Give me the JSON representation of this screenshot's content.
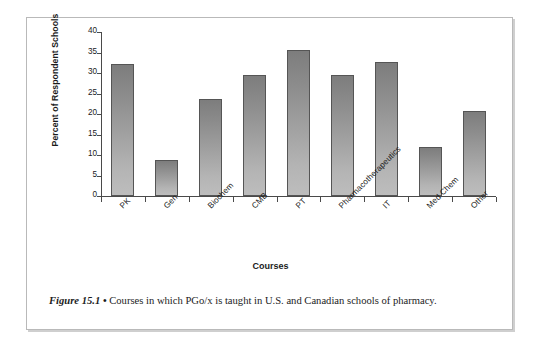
{
  "figure": {
    "caption_label": "Figure 15.1",
    "caption_bullet": "•",
    "caption_text": "Courses in which PGo/x is taught in U.S. and Canadian schools of pharmacy."
  },
  "colors": {
    "bar_top": "#7d7d7d",
    "bar_bottom": "#bdbdbd",
    "bar_border": "#555555",
    "axis": "#4a4a4a",
    "text": "#1b1b1b",
    "frame": "#b9b9b9",
    "background": "#ffffff"
  },
  "chart_data": {
    "type": "bar",
    "title": "",
    "xlabel": "Courses",
    "ylabel": "Percent of Respondent Schools",
    "ylim": [
      0,
      40
    ],
    "yticks": [
      0,
      5,
      10,
      15,
      20,
      25,
      30,
      35,
      40
    ],
    "ytick_labels": [
      "0",
      "5",
      "10",
      "15",
      "20",
      "25",
      "30",
      "35",
      "40"
    ],
    "grid": false,
    "legend": false,
    "categories": [
      "PK",
      "Gen",
      "Biochem",
      "CMB",
      "PT",
      "Pharmacotherapeutics",
      "IT",
      "Med Chem",
      "Other"
    ],
    "values": [
      32.3,
      8.8,
      23.7,
      29.5,
      35.5,
      29.5,
      32.6,
      12.0,
      20.8
    ]
  }
}
